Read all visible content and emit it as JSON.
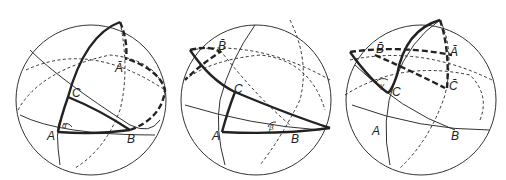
{
  "diagram": {
    "type": "spherical-triangles",
    "panels": [
      {
        "id": "left",
        "labels": {
          "A": "A",
          "B": "B",
          "C": "C",
          "Abar": "Ā",
          "angle": "α"
        }
      },
      {
        "id": "middle",
        "labels": {
          "A": "A",
          "B": "B",
          "C": "C",
          "Bbar": "B̄",
          "angle": "β"
        }
      },
      {
        "id": "right",
        "labels": {
          "A": "A",
          "B": "B",
          "C": "C",
          "Abar": "Ā",
          "Bbar": "B̄",
          "Cbar": "C̄",
          "angle": "γ"
        }
      }
    ],
    "colors": {
      "stroke": "#222222",
      "background": "#ffffff"
    }
  }
}
